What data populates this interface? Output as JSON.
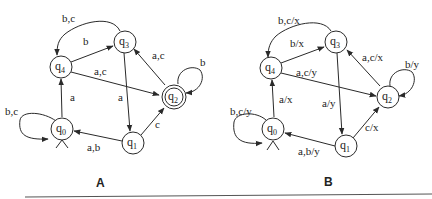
{
  "figures": [
    {
      "caption": "A",
      "states": [
        {
          "id": "q0",
          "name": "q",
          "sub": "0",
          "initial": true,
          "accepting": false
        },
        {
          "id": "q1",
          "name": "q",
          "sub": "1",
          "initial": false,
          "accepting": false
        },
        {
          "id": "q2",
          "name": "q",
          "sub": "2",
          "initial": false,
          "accepting": true
        },
        {
          "id": "q3",
          "name": "q",
          "sub": "3",
          "initial": false,
          "accepting": false
        },
        {
          "id": "q4",
          "name": "q",
          "sub": "4",
          "initial": false,
          "accepting": false
        }
      ],
      "transitions": [
        {
          "from": "q0",
          "to": "q0",
          "label": "b,c"
        },
        {
          "from": "q0",
          "to": "q4",
          "label": "a"
        },
        {
          "from": "q4",
          "to": "q3",
          "label": "b"
        },
        {
          "from": "q3",
          "to": "q4",
          "label": "b,c"
        },
        {
          "from": "q4",
          "to": "q2",
          "label": "a,c"
        },
        {
          "from": "q3",
          "to": "q1",
          "label": "a"
        },
        {
          "from": "q2",
          "to": "q3",
          "label": "a,c"
        },
        {
          "from": "q2",
          "to": "q2",
          "label": "b"
        },
        {
          "from": "q1",
          "to": "q2",
          "label": "c"
        },
        {
          "from": "q1",
          "to": "q0",
          "label": "a,b"
        }
      ]
    },
    {
      "caption": "B",
      "states": [
        {
          "id": "q0",
          "name": "q",
          "sub": "0",
          "initial": true,
          "accepting": false
        },
        {
          "id": "q1",
          "name": "q",
          "sub": "1",
          "initial": false,
          "accepting": false
        },
        {
          "id": "q2",
          "name": "q",
          "sub": "2",
          "initial": false,
          "accepting": false
        },
        {
          "id": "q3",
          "name": "q",
          "sub": "3",
          "initial": false,
          "accepting": false
        },
        {
          "id": "q4",
          "name": "q",
          "sub": "4",
          "initial": false,
          "accepting": false
        }
      ],
      "transitions": [
        {
          "from": "q0",
          "to": "q0",
          "label": "b,c/y"
        },
        {
          "from": "q0",
          "to": "q4",
          "label": "a/x"
        },
        {
          "from": "q4",
          "to": "q3",
          "label": "b/x"
        },
        {
          "from": "q3",
          "to": "q4",
          "label": "b,c/x"
        },
        {
          "from": "q4",
          "to": "q2",
          "label": "a,c/y"
        },
        {
          "from": "q3",
          "to": "q1",
          "label": "a/y"
        },
        {
          "from": "q2",
          "to": "q3",
          "label": "a,c/x"
        },
        {
          "from": "q2",
          "to": "q2",
          "label": "b/y"
        },
        {
          "from": "q1",
          "to": "q2",
          "label": "c/x"
        },
        {
          "from": "q1",
          "to": "q0",
          "label": "a,b/y"
        }
      ]
    }
  ]
}
